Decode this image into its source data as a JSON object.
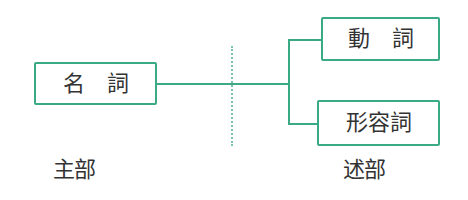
{
  "diagram": {
    "colors": {
      "line": "#3aa985",
      "divider": "#7cc2ac",
      "text": "#333333"
    },
    "subject": {
      "box": {
        "label": "名　詞"
      },
      "section_label": "主部"
    },
    "predicate": {
      "boxes": [
        {
          "label": "動　詞"
        },
        {
          "label": "形容詞"
        }
      ],
      "section_label": "述部"
    }
  }
}
